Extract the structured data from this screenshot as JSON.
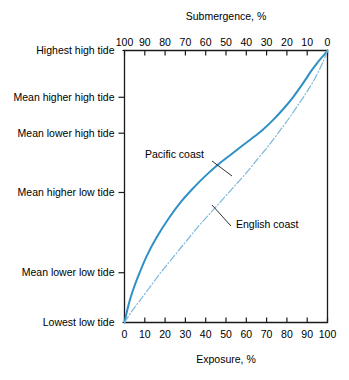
{
  "chart_data": {
    "type": "line",
    "title": "",
    "top_axis_label": "Submergence, %",
    "bottom_axis_label": "Exposure, %",
    "xlabel": "Exposure, %",
    "ylabel": "",
    "grid": false,
    "legend_position": "inline-annotation",
    "xlim": [
      0,
      100
    ],
    "x_ticks_bottom": [
      "0",
      "10",
      "20",
      "30",
      "40",
      "50",
      "60",
      "70",
      "80",
      "90",
      "100"
    ],
    "x_ticks_top": [
      "100",
      "90",
      "80",
      "70",
      "60",
      "50",
      "40",
      "30",
      "20",
      "10",
      "0"
    ],
    "y_tick_labels": [
      "Highest high tide",
      "Mean higher high tide",
      "Mean lower high tide",
      "Mean higher low tide",
      "Mean lower low tide",
      "Lowest low tide"
    ],
    "y_tick_positions_pct": [
      100,
      82.8,
      69.6,
      47.8,
      18.3,
      0
    ],
    "colors": {
      "pacific": "#2e90c4",
      "english": "#7fb9da",
      "axis": "#1a1a1a"
    },
    "series": [
      {
        "name": "Pacific coast",
        "style": "solid",
        "color": "#2e90c4",
        "x": [
          0,
          2,
          4,
          7,
          11,
          16,
          22,
          28,
          34,
          40,
          46,
          52,
          58,
          63,
          68,
          73,
          78,
          83,
          88,
          92,
          95,
          97,
          99,
          100
        ],
        "y": [
          0,
          6.5,
          11.5,
          17.5,
          24.5,
          31.5,
          38.5,
          44.5,
          49.5,
          54.0,
          58.0,
          61.5,
          65.0,
          67.8,
          70.8,
          74.3,
          78.3,
          82.8,
          88.0,
          92.5,
          95.5,
          97.3,
          99.0,
          100
        ]
      },
      {
        "name": "English coast",
        "style": "dash-dot",
        "color": "#7fb9da",
        "x": [
          0,
          3,
          7,
          12,
          18,
          24,
          30,
          36,
          42,
          48,
          54,
          60,
          66,
          71,
          76,
          81,
          86,
          90,
          94,
          97,
          99,
          100
        ],
        "y": [
          0,
          3.5,
          7.5,
          12.5,
          18.5,
          24.0,
          29.5,
          35.0,
          40.0,
          45.0,
          50.0,
          55.0,
          60.5,
          65.0,
          70.0,
          75.0,
          80.5,
          85.0,
          90.0,
          94.5,
          98.0,
          100
        ]
      }
    ],
    "annotations": [
      {
        "text": "Pacific coast",
        "x_px": 145,
        "y_px": 158
      },
      {
        "text": "English coast",
        "x_px": 236,
        "y_px": 228
      }
    ]
  }
}
